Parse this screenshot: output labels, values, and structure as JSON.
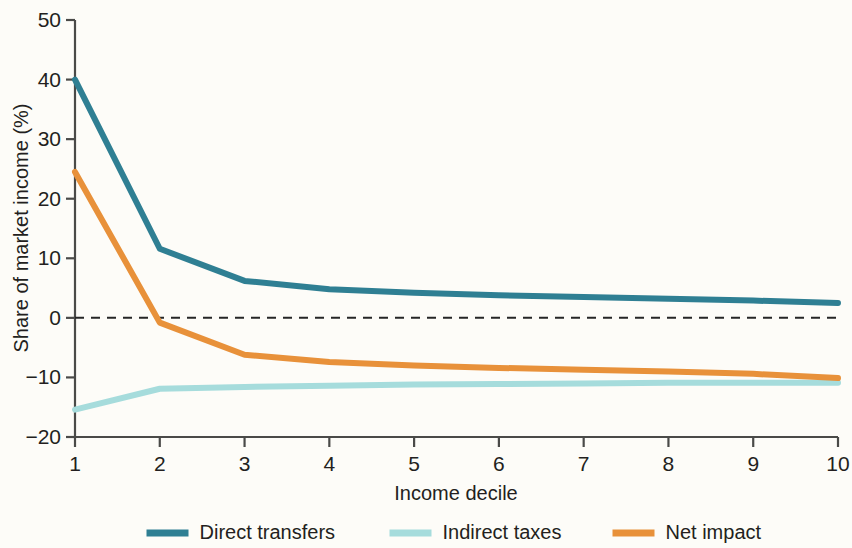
{
  "chart_data": {
    "type": "line",
    "title": "",
    "subtitle": "",
    "xlabel": "Income decile",
    "ylabel": "Share of market income (%)",
    "x": [
      1,
      2,
      3,
      4,
      5,
      6,
      7,
      8,
      9,
      10
    ],
    "categories": [
      "1",
      "2",
      "3",
      "4",
      "5",
      "6",
      "7",
      "8",
      "9",
      "10"
    ],
    "xtick_labels": [
      "1",
      "2",
      "3",
      "4",
      "5",
      "6",
      "7",
      "8",
      "9",
      "10"
    ],
    "ytick_labels": [
      "50",
      "40",
      "30",
      "20",
      "10",
      "0",
      "−10",
      "−20"
    ],
    "ytick_values": [
      50,
      40,
      30,
      20,
      10,
      0,
      -10,
      -20
    ],
    "xlim": [
      1,
      10
    ],
    "ylim": [
      -20,
      50
    ],
    "grid": false,
    "zero_line": true,
    "zero_line_style": "dashed",
    "legend_position": "bottom",
    "series": [
      {
        "name": "Direct transfers",
        "color": "#2f7f93",
        "values": [
          40.0,
          11.6,
          6.2,
          4.8,
          4.2,
          3.8,
          3.5,
          3.2,
          2.9,
          2.5
        ]
      },
      {
        "name": "Indirect taxes",
        "color": "#a6dcdc",
        "values": [
          -15.4,
          -11.9,
          -11.6,
          -11.4,
          -11.2,
          -11.1,
          -11.0,
          -10.9,
          -10.9,
          -10.9
        ]
      },
      {
        "name": "Net impact",
        "color": "#e8913a",
        "values": [
          24.5,
          -0.8,
          -6.2,
          -7.4,
          -8.0,
          -8.4,
          -8.7,
          -9.0,
          -9.4,
          -10.1
        ]
      }
    ]
  },
  "axes": {
    "y_title": "Share of market income (%)",
    "x_title": "Income decile",
    "y_ticks": [
      "50",
      "40",
      "30",
      "20",
      "10",
      "0",
      "−10",
      "−20"
    ],
    "x_ticks": [
      "1",
      "2",
      "3",
      "4",
      "5",
      "6",
      "7",
      "8",
      "9",
      "10"
    ]
  },
  "legend": {
    "items": [
      {
        "label": "Direct transfers",
        "color": "#2f7f93"
      },
      {
        "label": "Indirect taxes",
        "color": "#a6dcdc"
      },
      {
        "label": "Net impact",
        "color": "#e8913a"
      }
    ]
  },
  "colors": {
    "background": "#fdfcf8",
    "axis": "#4a4a48",
    "text": "#231f20",
    "zero_line": "#262626",
    "direct_transfers": "#2f7f93",
    "indirect_taxes": "#a6dcdc",
    "net_impact": "#e8913a"
  }
}
